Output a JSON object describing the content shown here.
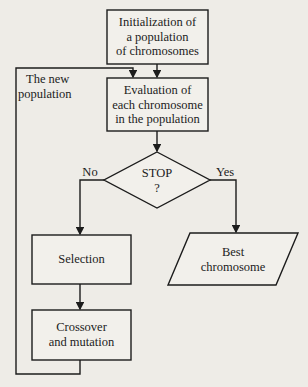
{
  "diagram": {
    "nodes": {
      "init": {
        "type": "process",
        "lines": [
          "Initialization of",
          "a population",
          "of chromosomes"
        ]
      },
      "evaluation": {
        "type": "process",
        "lines": [
          "Evaluation of",
          "each chromosome",
          "in the population"
        ]
      },
      "stop": {
        "type": "decision",
        "lines": [
          "STOP",
          "?"
        ]
      },
      "selection": {
        "type": "process",
        "lines": [
          "Selection"
        ]
      },
      "crossover": {
        "type": "process",
        "lines": [
          "Crossover",
          "and mutation"
        ]
      },
      "best": {
        "type": "io",
        "lines": [
          "Best",
          "chromosome"
        ]
      }
    },
    "loop_label": {
      "lines": [
        "The new",
        "population"
      ]
    },
    "edges": [
      {
        "from": "init",
        "to": "evaluation",
        "label": ""
      },
      {
        "from": "evaluation",
        "to": "stop",
        "label": ""
      },
      {
        "from": "stop",
        "to": "selection",
        "label": "No"
      },
      {
        "from": "stop",
        "to": "best",
        "label": "Yes"
      },
      {
        "from": "selection",
        "to": "crossover",
        "label": ""
      },
      {
        "from": "crossover",
        "to": "evaluation",
        "label": "The new population"
      }
    ],
    "colors": {
      "line": "#1c1c1c",
      "background": "#eeece7",
      "box_fill": "#f2f0eb"
    }
  }
}
